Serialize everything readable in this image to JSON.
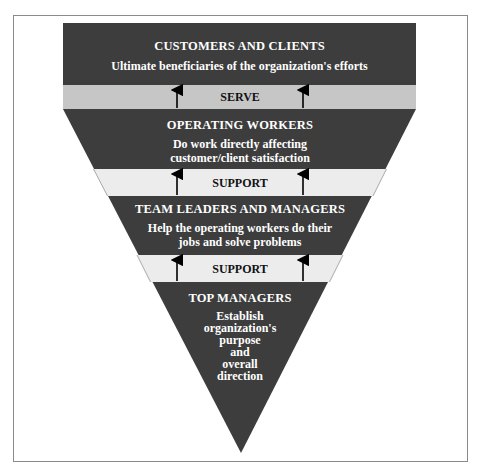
{
  "colors": {
    "dark": "#3d3d3d",
    "serve_band": "#c6c6c6",
    "support_band": "#ececec",
    "frame": "#8a8a8a"
  },
  "levels": [
    {
      "title": "CUSTOMERS AND CLIENTS",
      "description": "Ultimate beneficiaries of the organization's efforts"
    },
    {
      "title": "OPERATING WORKERS",
      "description_lines": [
        "Do work directly affecting",
        "customer/client satisfaction"
      ]
    },
    {
      "title": "TEAM LEADERS AND MANAGERS",
      "description_lines": [
        "Help the operating workers do their",
        "jobs and solve problems"
      ]
    },
    {
      "title": "TOP MANAGERS",
      "description_lines": [
        "Establish",
        "organization's",
        "purpose",
        "and",
        "overall",
        "direction"
      ]
    }
  ],
  "connectors": [
    {
      "label": "SERVE"
    },
    {
      "label": "SUPPORT"
    },
    {
      "label": "SUPPORT"
    }
  ]
}
